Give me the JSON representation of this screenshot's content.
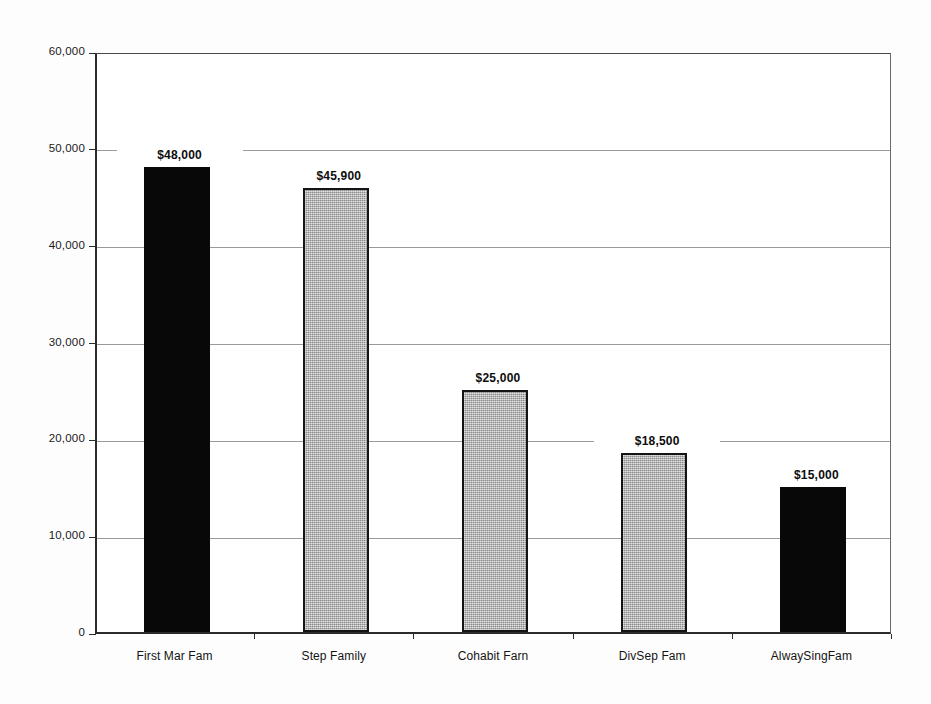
{
  "chart_data": {
    "type": "bar",
    "title": "",
    "subtitle": "",
    "xlabel": "",
    "ylabel": "",
    "ylim": [
      0,
      60000
    ],
    "grid": true,
    "legend": "none",
    "categories": [
      "First Mar Fam",
      "Step Family",
      "Cohabit Farn",
      "DivSep Fam",
      "AlwaySingFam"
    ],
    "values": [
      48000,
      45900,
      25000,
      18500,
      15000
    ],
    "data_labels": [
      "$48,000",
      "$45,900",
      "$25,000",
      "$18,500",
      "$15,000"
    ],
    "bar_styles": [
      "black",
      "gray",
      "gray",
      "gray",
      "black"
    ],
    "ytick_values": [
      0,
      10000,
      20000,
      30000,
      40000,
      50000,
      60000
    ],
    "ytick_labels": [
      "0",
      "10,000",
      "20,000",
      "30,000",
      "40,000",
      "50,000",
      "60,000"
    ]
  },
  "colors": {
    "bar_black": "#080808",
    "bar_gray": "#b2b2b2",
    "bar_border": "#141414",
    "gridline": "#9a9a9a",
    "axis": "#2b2b2b",
    "text": "#141414",
    "background": "#fdfdfd",
    "plot_background": "#ffffff"
  }
}
